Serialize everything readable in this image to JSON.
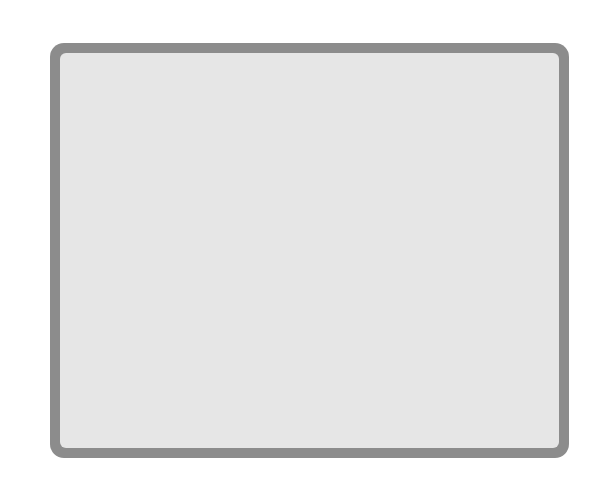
{
  "edge_labels": {
    "top": "Peptide ABC transport systems",
    "left": "Sugar ABC transport systems"
  },
  "pathways": {
    "pentose_l1": "PENTOSE PHOSPHATE",
    "pentose_l2": "PATHWAY",
    "entner_l1": "ENTNER",
    "entner_l2": "DOUDOROFF",
    "entner_l3": "PATHWAY",
    "glycolysis": "Glycolysis"
  },
  "metabolites": {
    "glucose": "Glucose",
    "gluconate": "Gluconate",
    "glucose6p": "Glucose-6-P",
    "phosphogluconate": "6 Phosphogluconate",
    "kdpg": "KDPG",
    "gly3p_right": "Gly-3-P",
    "plus": "+",
    "pyruvate_right": "Pyruvate",
    "fructose6p": "Fructose-6-P",
    "gly3p_left": "Gly-3-P",
    "dhap": "DHAP",
    "glycerol3p": "Glycerol-3-P",
    "glycerol": "Glycerol",
    "pep": "PEP",
    "aspartate_left": "Aspartate",
    "malate": "Malate",
    "pyruvate": "Pyruvate",
    "oxaloacetate": "Oxaloacetate",
    "aspartate_right": "Aspartate",
    "valine": "Valine",
    "lactate": "Lactate",
    "h2co2": "H₂ and CO₂",
    "acetylcoa": "Acetyl-CoA",
    "or": "OR",
    "akg": "α-ketoglutarate",
    "aldehydes": "Aldehydes",
    "ketoisovalerate": "Ketoisovalerate",
    "glutamate": "Glutamate",
    "proline": "Proline",
    "glutamine": "Glutamine",
    "leucine": "Leucine",
    "adp": "ADP + Pᵢ",
    "atp": "ATP",
    "glycine": "Glycine",
    "acetamide": "Acetamide",
    "threonine": "Threonine",
    "nh3": "NH₃ + CO₂ + H₂",
    "histidine": "Histidine",
    "prpp": "PRPP",
    "ribose5p": "Ribose-5-P"
  },
  "chemotaxis": {
    "genes_l1": "33 flagellar &",
    "genes_l2": "motor genes",
    "che": "cheA/B/C/D/R/W/Y",
    "mcps": "7 MCPs"
  },
  "right_labels": {
    "branched_l1": "Branched chain",
    "branched_l2": "amino acids",
    "amino": "Amino acids",
    "polyamines": "Polyamines",
    "phosphate": "Phosphate",
    "flagellum": "Flagellum",
    "zinc": "Zinc",
    "iron": "Iron",
    "chemo_l1": "Chemotactic",
    "chemo_l2": "signals",
    "cations1": "Cations",
    "cations2": "Cations"
  },
  "bottom_labels": {
    "ribose": "Ribose",
    "maltose": "Maltose",
    "glycerol3p": "Glycerol 3-P",
    "hplus": "H⁺",
    "atp_l1": "ATP",
    "atp_l2": "synthase",
    "glyc_l1": "Glycerol",
    "glyc_l2": "uptake",
    "uracil": "Uracil",
    "nh4": "NH₄⁺",
    "k": "K⁺",
    "fe": "Fe³⁺",
    "na": "Na⁺"
  },
  "colors": {
    "membrane": "#8c8c8c",
    "cytoplasm": "#e6e6e6",
    "transporter": "#a9a9a9",
    "pentose_box": "#c8c8c8",
    "chemo_circle": "#b8b8b8"
  }
}
